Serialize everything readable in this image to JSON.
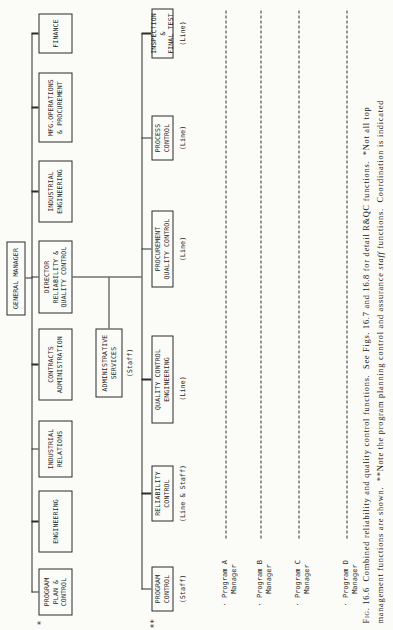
{
  "figure": {
    "paper_color": "#fbfbf8",
    "ink_color": "#2b2b2b",
    "general_manager": "GENERAL MANAGER",
    "top_row": [
      {
        "label": "PROGRAM\nPLAN &\nCONTROL"
      },
      {
        "label": "ENGINEERING"
      },
      {
        "label": "INDUSTRIAL\nRELATIONS"
      },
      {
        "label": "CONTRACTS\nADMINISTRATION"
      },
      {
        "label": "DIRECTOR\nRELIABILITY &\nQUALITY CONTROL"
      },
      {
        "label": "INDUSTRIAL\nENGINEERING"
      },
      {
        "label": "MFG.OPERATIONS\n& PROCUREMENT"
      },
      {
        "label": "FINANCE"
      }
    ],
    "admin_services": {
      "label": "ADMINISTRATIVE\nSERVICES",
      "annotation": "(Staff)"
    },
    "second_row": [
      {
        "label": "PROGRAM\nCONTROL",
        "annotation": "(Staff)"
      },
      {
        "label": "RELIABILITY\nCONTROL",
        "annotation": "(Line & Staff)"
      },
      {
        "label": "QUALITY CONTROL\nENGINEERING",
        "annotation": "(Line)"
      },
      {
        "label": "PROCUREMENT\nQUALITY CONTROL",
        "annotation": "(Line)"
      },
      {
        "label": "PROCESS\nCONTROL",
        "annotation": "(Line)"
      },
      {
        "label": "INSPECTION &\nFINAL TEST",
        "annotation": "(Line)"
      }
    ],
    "footnote_marks": {
      "program_plan": "*",
      "program_control": "**"
    },
    "program_managers": [
      {
        "label": "· Program A\n   Manager"
      },
      {
        "label": "· Program B\n   Manager"
      },
      {
        "label": "· Program C\n   Manager"
      },
      {
        "label": "· Program D\n   Manager"
      }
    ],
    "caption": {
      "fig_label": "Fig. 16.6",
      "line1_rest": "  Combined reliability and quality control functions.  See Figs. 16.7 and 16.8 for detail R&QC functions.  *Not all top",
      "line2_a": "management functions are shown.  **Note the program planning control and assurance ",
      "line2_staff": "staff",
      "line2_b": " functions.  Coordination is indicated"
    }
  }
}
